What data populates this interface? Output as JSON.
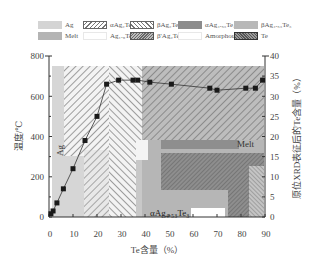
{
  "chart_data": {
    "type": "line",
    "title": "",
    "xlabel": "Te含量（%）",
    "ylabel_left": "温度/℃",
    "ylabel_right": "原位XRD表征后的Te含量（%）",
    "xlim": [
      0,
      90
    ],
    "ylim_left": [
      0,
      800
    ],
    "ylim_right": [
      0,
      40
    ],
    "x_ticks": [
      "0",
      "10",
      "20",
      "30",
      "40",
      "50",
      "60",
      "70",
      "80",
      "90"
    ],
    "y_left_ticks": [
      "0",
      "200",
      "400",
      "600",
      "800"
    ],
    "y_right_ticks": [
      "0",
      "5",
      "10",
      "15",
      "20",
      "25",
      "30",
      "35",
      "40"
    ],
    "grid": false,
    "legend_position": "top",
    "series": [
      {
        "name": "原位XRD表征后的Te含量",
        "axis": "right",
        "marker": "square",
        "x": [
          0.8,
          1.7,
          3.3,
          6,
          10,
          15,
          20,
          24,
          29,
          35,
          37,
          42,
          51,
          67,
          70,
          82,
          86,
          89
        ],
        "y": [
          0.8,
          1.5,
          3.5,
          7,
          12,
          19,
          25,
          33,
          34,
          34,
          34,
          33.5,
          33,
          32,
          31.5,
          32,
          32,
          34
        ]
      }
    ],
    "legend": [
      {
        "label": "Ag",
        "pattern": "solid-light-gray"
      },
      {
        "label": "αAg₂Te",
        "pattern": "hatch-forward"
      },
      {
        "label": "βAg₂Te",
        "pattern": "hatch-backward"
      },
      {
        "label": "αAg₄.₅₃Te₃",
        "pattern": "solid-dark-gray"
      },
      {
        "label": "βAg₄.₅₃Te₃",
        "pattern": "solid-mid-gray"
      },
      {
        "label": "Melt",
        "pattern": "solid-gray"
      },
      {
        "label": "Ag₁.₉Te",
        "pattern": "solid-white"
      },
      {
        "label": "β'Ag₂Te",
        "pattern": "hatch-dense"
      },
      {
        "label": "Amorphous",
        "pattern": "solid-white"
      },
      {
        "label": "Te",
        "pattern": "crosshatch-dark"
      }
    ],
    "annotations": [
      {
        "text": "Ag",
        "x": 7,
        "y_left": 310
      },
      {
        "text": "Melt",
        "x": 80,
        "y_left": 380
      },
      {
        "text": "αAg₄.₅₃Te₃",
        "x": 48,
        "y_left": 45
      }
    ],
    "regions": [
      {
        "phase": "Ag",
        "x": [
          0,
          14
        ],
        "y_left": [
          0,
          750
        ]
      },
      {
        "phase": "αAg₂Te",
        "x": [
          14,
          25
        ],
        "y_left": [
          0,
          750
        ]
      },
      {
        "phase": "βAg₂Te",
        "x": [
          25,
          40
        ],
        "y_left": [
          0,
          750
        ]
      },
      {
        "phase": "Melt",
        "x": [
          40,
          90
        ],
        "y_left": [
          400,
          750
        ]
      },
      {
        "phase": "αAg₄.₅₃Te₃",
        "x": [
          40,
          60
        ],
        "y_left": [
          0,
          400
        ]
      },
      {
        "phase": "Te",
        "x": [
          74,
          88
        ],
        "y_left": [
          0,
          280
        ]
      }
    ],
    "colors": {
      "Ag": "#d4d4d4",
      "Melt": "#b4b4b4",
      "dark": "#8c8c8c",
      "mid": "#a8a8a8",
      "line": "#222222"
    }
  },
  "legend_rows": [
    [
      {
        "label": "Ag",
        "swatch": "solid-ag"
      },
      {
        "label": "αAg₂Te",
        "swatch": "hatch-fwd"
      },
      {
        "label": "βAg₂Te",
        "swatch": "hatch-bwd"
      },
      {
        "label": "αAg₄.₅₃Te₃",
        "swatch": "solid-dark"
      },
      {
        "label": "βAg₄.₅₃Te₃",
        "swatch": "solid-mid"
      }
    ],
    [
      {
        "label": "Melt",
        "swatch": "solid-melt"
      },
      {
        "label": "Ag₁.₉Te",
        "swatch": "solid-white"
      },
      {
        "label": "β'Ag₂Te",
        "swatch": "hatch-dense"
      },
      {
        "label": "Amorphous",
        "swatch": "solid-white"
      },
      {
        "label": "Te",
        "swatch": "cross-dark"
      }
    ]
  ]
}
